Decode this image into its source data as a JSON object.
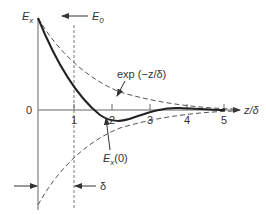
{
  "diagram": {
    "y_axis_label": "E",
    "y_axis_sub": "x",
    "incident_label": "E",
    "incident_sub": "0",
    "envelope_label": "exp (−z/δ)",
    "x_axis_label": "z/δ",
    "origin_label": "0",
    "x_ticks": [
      "1",
      "2",
      "3",
      "4",
      "5"
    ],
    "field_label": "E",
    "field_sub": "x",
    "field_arg": "(0)",
    "depth_label": "δ",
    "colors": {
      "line": "#333333",
      "axis": "#666666"
    }
  }
}
